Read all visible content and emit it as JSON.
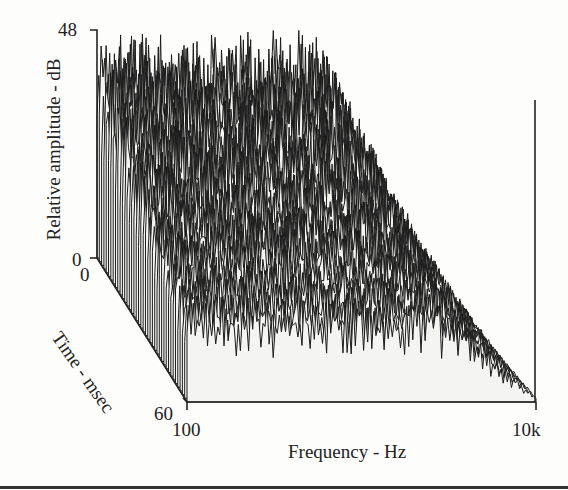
{
  "chart_data": {
    "type": "waterfall-3d",
    "title": "",
    "xlabel": "Frequency - Hz",
    "ylabel": "Relative amplitude - dB",
    "zlabel": "Time - msec",
    "x_ticks": [
      "100",
      "10k"
    ],
    "y_ticks": [
      "0",
      "48"
    ],
    "z_ticks": [
      "0",
      "60"
    ],
    "xlim": [
      100,
      10000
    ],
    "ylim": [
      0,
      48
    ],
    "zlim": [
      0,
      60
    ],
    "x_scale": "log",
    "grid": false,
    "legend": null,
    "series_summary": {
      "num_slices": 40,
      "plateau_level_db": 46,
      "rolloff_start_hz": 5000,
      "decay_with_time": true
    }
  },
  "labels": {
    "y_top": "48",
    "y_bottom": "0",
    "t_start": "0",
    "t_end": "60",
    "f_start": "100",
    "f_end": "10k",
    "x_axis_title": "Frequency - Hz",
    "y_axis_title": "Relative amplitude - dB",
    "t_axis_title": "Time - msec"
  }
}
